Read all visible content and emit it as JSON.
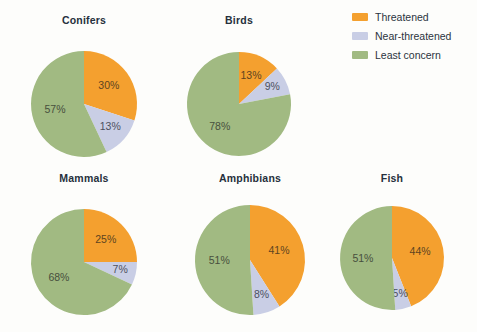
{
  "colors": {
    "threatened": "#f4a02f",
    "near_threatened": "#c9cee5",
    "least_concern": "#a1ba82",
    "background": "#fdfdfb",
    "title_text": "#26303c"
  },
  "legend": {
    "position": "top-right",
    "items": [
      {
        "label": "Threatened",
        "color": "#f4a02f"
      },
      {
        "label": "Near-threatened",
        "color": "#c9cee5"
      },
      {
        "label": "Least concern",
        "color": "#a1ba82"
      }
    ]
  },
  "chart_data": {
    "type": "pie",
    "title": "",
    "xlabel": "",
    "ylabel": "",
    "categories": [
      "Threatened",
      "Near-threatened",
      "Least concern"
    ],
    "legend_position": "top-right",
    "grid": false,
    "value_suffix": "%",
    "charts": [
      {
        "title": "Conifers",
        "labels": [
          "Threatened",
          "Near-threatened",
          "Least concern"
        ],
        "values": [
          30,
          13,
          57
        ],
        "value_labels": [
          "30%",
          "13%",
          "57%"
        ]
      },
      {
        "title": "Birds",
        "labels": [
          "Threatened",
          "Near-threatened",
          "Least concern"
        ],
        "values": [
          13,
          9,
          78
        ],
        "value_labels": [
          "13%",
          "9%",
          "78%"
        ]
      },
      {
        "title": "Mammals",
        "labels": [
          "Threatened",
          "Near-threatened",
          "Least concern"
        ],
        "values": [
          25,
          7,
          68
        ],
        "value_labels": [
          "25%",
          "7%",
          "68%"
        ]
      },
      {
        "title": "Amphibians",
        "labels": [
          "Threatened",
          "Near-threatened",
          "Least concern"
        ],
        "values": [
          41,
          8,
          51
        ],
        "value_labels": [
          "41%",
          "8%",
          "51%"
        ]
      },
      {
        "title": "Fish",
        "labels": [
          "Threatened",
          "Near-threatened",
          "Least concern"
        ],
        "values": [
          44,
          5,
          51
        ],
        "value_labels": [
          "44%",
          "5%",
          "51%"
        ]
      }
    ]
  },
  "layout": {
    "pies": [
      {
        "cx": 84,
        "cy": 104,
        "r": 53,
        "title_y": 14,
        "label_r_factor": [
          0.58,
          0.66,
          0.56
        ]
      },
      {
        "cx": 239,
        "cy": 104,
        "r": 52,
        "title_y": 14,
        "label_r_factor": [
          0.58,
          0.72,
          0.58
        ]
      },
      {
        "cx": 84,
        "cy": 262,
        "r": 53,
        "title_y": 172,
        "label_r_factor": [
          0.58,
          0.7,
          0.56
        ]
      },
      {
        "cx": 250,
        "cy": 260,
        "r": 55,
        "title_y": 172,
        "label_r_factor": [
          0.55,
          0.68,
          0.56
        ]
      },
      {
        "cx": 392,
        "cy": 258,
        "r": 52,
        "title_y": 172,
        "label_r_factor": [
          0.55,
          0.72,
          0.56
        ]
      }
    ]
  }
}
